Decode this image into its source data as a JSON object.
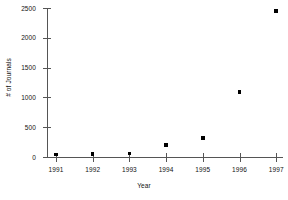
{
  "chart_data": {
    "type": "scatter",
    "title": "",
    "xlabel": "Year",
    "ylabel": "# of Journals",
    "categories": [
      "1991",
      "1992",
      "1993",
      "1994",
      "1995",
      "1996",
      "1997"
    ],
    "x": [
      1991,
      1992,
      1993,
      1994,
      1995,
      1996,
      1997
    ],
    "values": [
      45,
      55,
      60,
      200,
      320,
      1090,
      2450
    ],
    "series": [
      {
        "name": "# of Journals",
        "values": [
          45,
          55,
          60,
          200,
          320,
          1090,
          2450
        ]
      }
    ],
    "xlim": [
      1990.6,
      1997.4
    ],
    "ylim": [
      0,
      2500
    ],
    "ytick_labels": [
      "0",
      "500",
      "1000",
      "1500",
      "2000",
      "2500"
    ],
    "ytick_values": [
      0,
      500,
      1000,
      1500,
      2000,
      2500
    ],
    "xtick_labels": [
      "1991",
      "1992",
      "1993",
      "1994",
      "1995",
      "1996",
      "1997"
    ],
    "grid": false,
    "legend": false,
    "marker": "filled-square",
    "marker_color": "#000000",
    "axis_color": "#555555",
    "background_color": "#ffffff"
  }
}
